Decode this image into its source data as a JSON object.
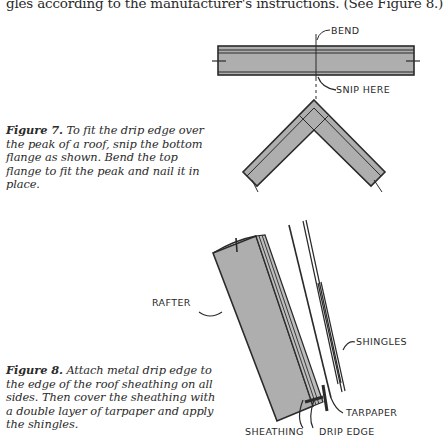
{
  "body_text": {
    "line": "gles according to the manufacturer's instructions. (See Figure 8.)"
  },
  "figure7": {
    "label": "Figure 7.",
    "caption": " To fit the drip edge over the peak of a roof, snip the bottom flange as shown. Bend the top flange to fit the peak and nail it in place.",
    "callouts": {
      "bend": "BEND",
      "snip_here": "SNIP HERE"
    }
  },
  "figure8": {
    "label": "Figure 8.",
    "caption": " Attach metal drip edge to the edge of the roof sheathing on all sides. Then cover the sheathing with a double layer of tarpaper and apply the shingles.",
    "callouts": {
      "rafter": "RAFTER",
      "shingles": "SHINGLES",
      "tarpaper": "TARPAPER",
      "sheathing": "SHEATHING",
      "drip_edge": "DRIP EDGE"
    }
  },
  "colors": {
    "metal_fill": "#aeaeae",
    "line": "#2a2a2a"
  }
}
